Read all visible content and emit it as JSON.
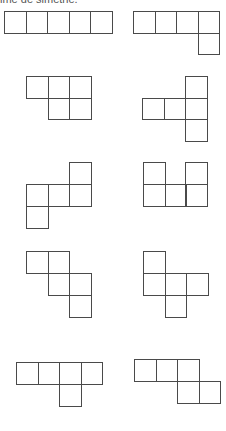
{
  "caption": "ime de simetrie.",
  "colors": {
    "stroke": "#4a4a4a",
    "background": "#ffffff"
  },
  "cell_size": 21.5,
  "shapes": [
    {
      "id": "shape-1",
      "description": "five squares in a row",
      "cells": [
        [
          4,
          11
        ],
        [
          25.5,
          11
        ],
        [
          47,
          11
        ],
        [
          68.5,
          11
        ],
        [
          90,
          11
        ]
      ]
    },
    {
      "id": "shape-2",
      "description": "four in a row with one below the right end",
      "cells": [
        [
          133,
          11
        ],
        [
          154.5,
          11
        ],
        [
          176,
          11
        ],
        [
          197.5,
          11
        ],
        [
          197.5,
          32.5
        ]
      ]
    },
    {
      "id": "shape-3",
      "description": "three on top, two below right",
      "cells": [
        [
          26,
          76
        ],
        [
          47.5,
          76
        ],
        [
          69,
          76
        ],
        [
          47.5,
          97.5
        ],
        [
          69,
          97.5
        ]
      ]
    },
    {
      "id": "shape-4",
      "description": "T rotated, three in middle row, one above and below right",
      "cells": [
        [
          185,
          76
        ],
        [
          142,
          97.5
        ],
        [
          163.5,
          97.5
        ],
        [
          185,
          97.5
        ],
        [
          185,
          119
        ]
      ]
    },
    {
      "id": "shape-5",
      "description": "S-like with three in middle row",
      "cells": [
        [
          69,
          162
        ],
        [
          26,
          184
        ],
        [
          47.5,
          184
        ],
        [
          69,
          184
        ],
        [
          26,
          206
        ]
      ]
    },
    {
      "id": "shape-6",
      "description": "U shape",
      "cells": [
        [
          143,
          162
        ],
        [
          185,
          162
        ],
        [
          143,
          184
        ],
        [
          164.5,
          184
        ],
        [
          185,
          184
        ]
      ]
    },
    {
      "id": "shape-7",
      "description": "W staircase",
      "cells": [
        [
          26,
          251
        ],
        [
          47.5,
          251
        ],
        [
          47.5,
          273
        ],
        [
          69,
          273
        ],
        [
          69,
          295
        ]
      ]
    },
    {
      "id": "shape-8",
      "description": "F-like cross variant",
      "cells": [
        [
          143,
          251
        ],
        [
          143,
          273
        ],
        [
          164.5,
          273
        ],
        [
          186,
          273
        ],
        [
          164.5,
          295
        ]
      ]
    },
    {
      "id": "shape-9",
      "description": "four in a row with one below third",
      "cells": [
        [
          16,
          362
        ],
        [
          37.5,
          362
        ],
        [
          59,
          362
        ],
        [
          80.5,
          362
        ],
        [
          59,
          384
        ]
      ]
    },
    {
      "id": "shape-10",
      "description": "three on top, two below shifted right",
      "cells": [
        [
          134,
          359
        ],
        [
          155.5,
          359
        ],
        [
          177,
          359
        ],
        [
          177,
          381
        ],
        [
          198.5,
          381
        ]
      ]
    }
  ]
}
